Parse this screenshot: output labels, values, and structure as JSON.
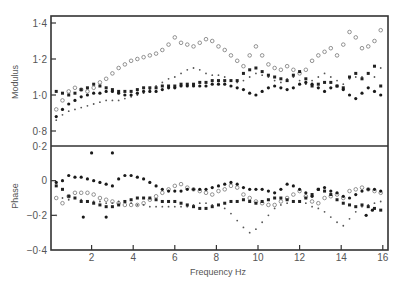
{
  "chart_data": [
    {
      "panel": "upper",
      "type": "scatter",
      "title": "",
      "xlabel": "",
      "ylabel": "Modulus",
      "xlim": [
        0,
        16.3
      ],
      "ylim": [
        0.8,
        1.44
      ],
      "yticks": [
        0.8,
        1.0,
        1.2,
        1.4
      ],
      "ytick_labels": [
        "0·8",
        "1·0",
        "1·2",
        "1·4"
      ],
      "grid": false,
      "legend": "none",
      "series": [
        {
          "name": "open-circles",
          "marker": "open-circle",
          "x": [
            0.3,
            0.6,
            0.9,
            1.2,
            1.5,
            1.8,
            2.1,
            2.4,
            2.7,
            3.0,
            3.3,
            3.6,
            3.9,
            4.2,
            4.5,
            4.8,
            5.1,
            5.4,
            5.7,
            6.0,
            6.3,
            6.6,
            6.9,
            7.2,
            7.5,
            7.8,
            8.1,
            8.4,
            8.7,
            9.0,
            9.3,
            9.6,
            9.9,
            10.2,
            10.5,
            10.8,
            11.1,
            11.4,
            11.7,
            12.0,
            12.3,
            12.6,
            12.9,
            13.2,
            13.5,
            13.8,
            14.1,
            14.4,
            14.7,
            15.0,
            15.3,
            15.6,
            15.9
          ],
          "y": [
            0.92,
            0.97,
            1.02,
            1.04,
            1.03,
            1.02,
            1.04,
            1.07,
            1.09,
            1.12,
            1.15,
            1.17,
            1.19,
            1.2,
            1.21,
            1.22,
            1.23,
            1.25,
            1.28,
            1.32,
            1.29,
            1.28,
            1.27,
            1.29,
            1.31,
            1.3,
            1.27,
            1.25,
            1.22,
            1.19,
            1.16,
            1.22,
            1.27,
            1.22,
            1.17,
            1.15,
            1.14,
            1.16,
            1.14,
            1.12,
            1.14,
            1.19,
            1.22,
            1.24,
            1.26,
            1.22,
            1.28,
            1.35,
            1.32,
            1.26,
            1.27,
            1.3,
            1.36
          ]
        },
        {
          "name": "small-dots",
          "marker": "small-dot",
          "x": [
            0.3,
            0.6,
            0.9,
            1.2,
            1.5,
            1.8,
            2.1,
            2.4,
            2.7,
            3.0,
            3.3,
            3.6,
            3.9,
            4.2,
            4.5,
            4.8,
            5.1,
            5.4,
            5.7,
            6.0,
            6.3,
            6.6,
            6.9,
            7.2,
            7.5,
            7.8,
            8.1,
            8.4,
            8.7,
            9.0,
            9.3,
            9.6,
            9.9,
            10.2,
            10.5,
            10.8,
            11.1,
            11.4,
            11.7,
            12.0,
            12.3,
            12.6,
            12.9,
            13.2,
            13.5,
            13.8,
            14.1,
            14.4,
            14.7,
            15.0,
            15.3,
            15.6,
            15.9
          ],
          "y": [
            0.86,
            0.89,
            0.91,
            0.92,
            0.93,
            0.94,
            0.95,
            0.96,
            0.97,
            0.97,
            0.97,
            0.98,
            0.99,
            1.0,
            1.01,
            1.03,
            1.05,
            1.07,
            1.09,
            1.1,
            1.12,
            1.14,
            1.15,
            1.14,
            1.12,
            1.11,
            1.11,
            1.1,
            1.08,
            1.07,
            1.08,
            1.1,
            1.12,
            1.11,
            1.1,
            1.08,
            1.07,
            1.09,
            1.1,
            1.08,
            1.06,
            1.08,
            1.1,
            1.12,
            1.1,
            1.08,
            1.06,
            1.09,
            1.1,
            1.1,
            1.12,
            1.1,
            1.15
          ]
        },
        {
          "name": "filled-squares",
          "marker": "filled-square",
          "x": [
            0.3,
            0.6,
            0.9,
            1.2,
            1.5,
            1.8,
            2.1,
            2.4,
            2.7,
            3.0,
            3.3,
            3.6,
            3.9,
            4.2,
            4.5,
            4.8,
            5.1,
            5.4,
            5.7,
            6.0,
            6.3,
            6.6,
            6.9,
            7.2,
            7.5,
            7.8,
            8.1,
            8.4,
            8.7,
            9.0,
            9.3,
            9.6,
            9.9,
            10.2,
            10.5,
            10.8,
            11.1,
            11.4,
            11.7,
            12.0,
            12.3,
            12.6,
            12.9,
            13.2,
            13.5,
            13.8,
            14.1,
            14.4,
            14.7,
            15.0,
            15.3,
            15.6,
            15.9
          ],
          "y": [
            1.02,
            1.01,
            1.0,
            1.01,
            1.03,
            1.04,
            1.06,
            1.05,
            1.04,
            1.03,
            1.02,
            1.02,
            1.02,
            1.03,
            1.04,
            1.04,
            1.04,
            1.05,
            1.05,
            1.05,
            1.06,
            1.06,
            1.06,
            1.07,
            1.07,
            1.08,
            1.08,
            1.08,
            1.08,
            1.08,
            1.12,
            1.14,
            1.15,
            1.13,
            1.11,
            1.1,
            1.09,
            1.08,
            1.11,
            1.13,
            1.09,
            1.05,
            1.06,
            1.07,
            1.07,
            1.05,
            1.04,
            1.1,
            1.12,
            1.09,
            1.12,
            1.16,
            1.05
          ]
        },
        {
          "name": "filled-circles",
          "marker": "filled-circle",
          "x": [
            0.3,
            0.6,
            0.9,
            1.2,
            1.5,
            1.8,
            2.1,
            2.4,
            2.7,
            3.0,
            3.3,
            3.6,
            3.9,
            4.2,
            4.5,
            4.8,
            5.1,
            5.4,
            5.7,
            6.0,
            6.3,
            6.6,
            6.9,
            7.2,
            7.5,
            7.8,
            8.1,
            8.4,
            8.7,
            9.0,
            9.3,
            9.6,
            9.9,
            10.2,
            10.5,
            10.8,
            11.1,
            11.4,
            11.7,
            12.0,
            12.3,
            12.6,
            12.9,
            13.2,
            13.5,
            13.8,
            14.1,
            14.4,
            14.7,
            15.0,
            15.3,
            15.6,
            15.9
          ],
          "y": [
            0.88,
            0.92,
            0.95,
            0.97,
            0.99,
            1.0,
            1.01,
            1.01,
            1.02,
            1.02,
            1.01,
            1.0,
            1.0,
            1.01,
            1.02,
            1.02,
            1.02,
            1.03,
            1.04,
            1.04,
            1.05,
            1.05,
            1.05,
            1.05,
            1.05,
            1.06,
            1.06,
            1.06,
            1.05,
            1.04,
            1.03,
            1.01,
            1.0,
            1.02,
            1.04,
            1.05,
            1.04,
            1.03,
            1.04,
            1.06,
            1.07,
            1.06,
            1.04,
            1.02,
            1.04,
            1.05,
            1.03,
            1.0,
            0.98,
            1.01,
            1.04,
            1.02,
            1.0
          ]
        }
      ]
    },
    {
      "panel": "lower",
      "type": "scatter",
      "title": "",
      "xlabel": "Frequency Hz",
      "ylabel": "Phase",
      "xlim": [
        0,
        16.3
      ],
      "ylim": [
        -0.4,
        0.2
      ],
      "xticks": [
        2,
        4,
        6,
        8,
        10,
        12,
        14,
        16
      ],
      "xtick_labels": [
        "2",
        "4",
        "6",
        "8",
        "10",
        "12",
        "14",
        "16"
      ],
      "yticks": [
        -0.4,
        -0.2,
        0,
        0.2
      ],
      "ytick_labels": [
        "−0·4",
        "−0·2",
        "0",
        "0·2"
      ],
      "grid": false,
      "legend": "none",
      "series": [
        {
          "name": "open-circles",
          "marker": "open-circle",
          "x": [
            0.3,
            0.6,
            0.9,
            1.2,
            1.5,
            1.8,
            2.1,
            2.4,
            2.7,
            3.0,
            3.3,
            3.6,
            3.9,
            4.2,
            4.5,
            4.8,
            5.1,
            5.4,
            5.7,
            6.0,
            6.3,
            6.6,
            6.9,
            7.2,
            7.5,
            7.8,
            8.1,
            8.4,
            8.7,
            9.0,
            9.3,
            9.6,
            9.9,
            10.2,
            10.5,
            10.8,
            11.1,
            11.4,
            11.7,
            12.0,
            12.3,
            12.6,
            12.9,
            13.2,
            13.5,
            13.8,
            14.1,
            14.4,
            14.7,
            15.0,
            15.3,
            15.6,
            15.9
          ],
          "y": [
            -0.1,
            -0.13,
            -0.09,
            -0.07,
            -0.07,
            -0.07,
            -0.08,
            -0.1,
            -0.11,
            -0.12,
            -0.13,
            -0.14,
            -0.14,
            -0.14,
            -0.13,
            -0.11,
            -0.09,
            -0.07,
            -0.05,
            -0.03,
            -0.02,
            -0.04,
            -0.05,
            -0.06,
            -0.07,
            -0.08,
            -0.06,
            -0.05,
            -0.03,
            -0.04,
            -0.08,
            -0.1,
            -0.12,
            -0.13,
            -0.14,
            -0.14,
            -0.12,
            -0.1,
            -0.08,
            -0.06,
            -0.09,
            -0.12,
            -0.13,
            -0.1,
            -0.09,
            -0.08,
            -0.1,
            -0.06,
            -0.05,
            -0.04,
            -0.05,
            -0.06,
            -0.07
          ]
        },
        {
          "name": "small-dots",
          "marker": "small-dot",
          "x": [
            0.3,
            0.6,
            0.9,
            1.2,
            1.5,
            1.8,
            2.1,
            2.4,
            2.7,
            3.0,
            3.3,
            3.6,
            3.9,
            4.2,
            4.5,
            4.8,
            5.1,
            5.4,
            5.7,
            6.0,
            6.3,
            6.6,
            6.9,
            7.2,
            7.5,
            7.8,
            8.1,
            8.4,
            8.7,
            9.0,
            9.3,
            9.6,
            9.9,
            10.2,
            10.5,
            10.8,
            11.1,
            11.4,
            11.7,
            12.0,
            12.3,
            12.6,
            12.9,
            13.2,
            13.5,
            13.8,
            14.1,
            14.4,
            14.7,
            15.0,
            15.3,
            15.6,
            15.9
          ],
          "y": [
            -0.2,
            -0.1,
            -0.11,
            -0.1,
            -0.11,
            -0.12,
            -0.12,
            -0.12,
            -0.13,
            -0.13,
            -0.12,
            -0.12,
            -0.13,
            -0.14,
            -0.14,
            -0.15,
            -0.15,
            -0.15,
            -0.15,
            -0.15,
            -0.15,
            -0.15,
            -0.14,
            -0.13,
            -0.13,
            -0.14,
            -0.14,
            -0.16,
            -0.19,
            -0.23,
            -0.27,
            -0.3,
            -0.28,
            -0.24,
            -0.2,
            -0.16,
            -0.14,
            -0.13,
            -0.12,
            -0.12,
            -0.13,
            -0.15,
            -0.16,
            -0.18,
            -0.21,
            -0.24,
            -0.26,
            -0.22,
            -0.18,
            -0.15,
            -0.14,
            -0.13,
            -0.12
          ]
        },
        {
          "name": "filled-squares",
          "marker": "filled-square",
          "x": [
            0.3,
            0.6,
            0.9,
            1.2,
            1.5,
            1.8,
            2.1,
            2.4,
            2.7,
            3.0,
            3.3,
            3.6,
            3.9,
            4.2,
            4.5,
            4.8,
            5.1,
            5.4,
            5.7,
            6.0,
            6.3,
            6.6,
            6.9,
            7.2,
            7.5,
            7.8,
            8.1,
            8.4,
            8.7,
            9.0,
            9.3,
            9.6,
            9.9,
            10.2,
            10.5,
            10.8,
            11.1,
            11.4,
            11.7,
            12.0,
            12.3,
            12.6,
            12.9,
            13.2,
            13.5,
            13.8,
            14.1,
            14.4,
            14.7,
            15.0,
            15.3,
            15.6,
            15.9
          ],
          "y": [
            -0.03,
            -0.05,
            -0.09,
            -0.1,
            -0.12,
            -0.12,
            -0.13,
            -0.14,
            -0.15,
            -0.15,
            -0.14,
            -0.12,
            -0.11,
            -0.1,
            -0.1,
            -0.1,
            -0.11,
            -0.12,
            -0.12,
            -0.12,
            -0.13,
            -0.14,
            -0.15,
            -0.16,
            -0.16,
            -0.15,
            -0.14,
            -0.13,
            -0.12,
            -0.12,
            -0.11,
            -0.12,
            -0.13,
            -0.12,
            -0.11,
            -0.1,
            -0.1,
            -0.11,
            -0.12,
            -0.12,
            -0.1,
            -0.08,
            -0.05,
            -0.06,
            -0.08,
            -0.11,
            -0.13,
            -0.14,
            -0.15,
            -0.14,
            -0.15,
            -0.16,
            -0.17
          ]
        },
        {
          "name": "filled-circles",
          "marker": "filled-circle",
          "x": [
            0.3,
            0.6,
            0.9,
            1.2,
            1.5,
            1.8,
            2.1,
            2.4,
            2.7,
            3.0,
            3.3,
            3.6,
            3.9,
            4.2,
            4.5,
            4.8,
            5.1,
            5.4,
            5.7,
            6.0,
            6.3,
            6.6,
            6.9,
            7.2,
            7.5,
            7.8,
            8.1,
            8.4,
            8.7,
            9.0,
            9.3,
            9.6,
            9.9,
            10.2,
            10.5,
            10.8,
            11.1,
            11.4,
            11.7,
            12.0,
            12.3,
            12.6,
            12.9,
            13.2,
            13.5,
            13.8,
            14.1,
            14.4,
            14.7,
            15.0,
            15.3,
            15.6,
            15.9
          ],
          "y": [
            -0.01,
            0.0,
            0.03,
            0.02,
            0.02,
            0.01,
            0.0,
            -0.01,
            -0.02,
            -0.03,
            0.01,
            0.03,
            0.03,
            0.02,
            0.01,
            -0.01,
            -0.03,
            -0.05,
            -0.06,
            -0.06,
            -0.06,
            -0.05,
            -0.05,
            -0.05,
            -0.05,
            -0.04,
            -0.03,
            -0.02,
            -0.01,
            -0.02,
            -0.04,
            -0.05,
            -0.05,
            -0.05,
            -0.06,
            -0.07,
            -0.05,
            -0.02,
            -0.03,
            -0.05,
            -0.07,
            -0.09,
            -0.05,
            -0.04,
            -0.06,
            -0.07,
            -0.09,
            -0.1,
            -0.08,
            -0.06,
            -0.05,
            -0.05,
            -0.06
          ]
        },
        {
          "name": "outliers",
          "marker": "filled-circle",
          "x": [
            2.0,
            3.0,
            1.6,
            2.7,
            15.2,
            15.5
          ],
          "y": [
            0.16,
            0.16,
            -0.21,
            -0.21,
            -0.2,
            -0.17
          ]
        }
      ]
    }
  ]
}
